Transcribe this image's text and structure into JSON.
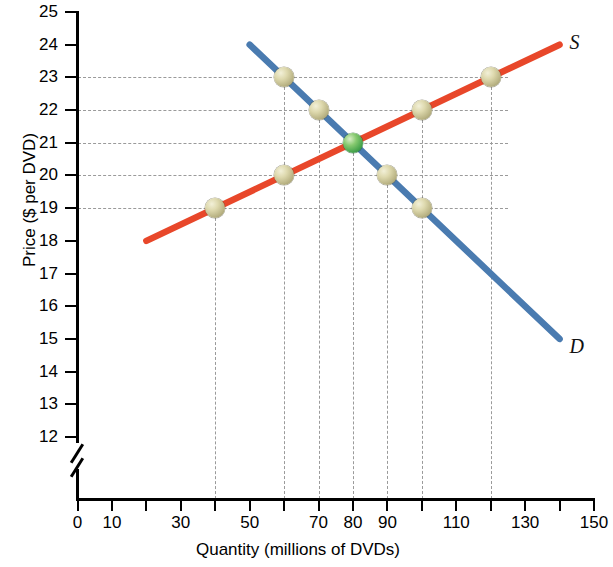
{
  "chart_data": {
    "type": "line",
    "title": "",
    "xlabel": "Quantity (millions of DVDs)",
    "ylabel": "Price ($ per DVD)",
    "xlim": [
      0,
      150
    ],
    "ylim": [
      12,
      25
    ],
    "y_axis_break_below": 12,
    "grid": true,
    "legend_position": "inline-curve-labels",
    "xticks": [
      0,
      10,
      20,
      30,
      40,
      50,
      60,
      70,
      80,
      90,
      100,
      110,
      120,
      130,
      140,
      150
    ],
    "xtick_labels": [
      "0",
      "10",
      "",
      "30",
      "",
      "50",
      "",
      "70",
      "80",
      "90",
      "",
      "110",
      "",
      "130",
      "",
      "150"
    ],
    "yticks": [
      12,
      13,
      14,
      15,
      16,
      17,
      18,
      19,
      20,
      21,
      22,
      23,
      24,
      25
    ],
    "ytick_labels": [
      "12",
      "13",
      "14",
      "15",
      "16",
      "17",
      "18",
      "19",
      "20",
      "21",
      "22",
      "23",
      "24",
      "25"
    ],
    "gridline_prices": [
      19,
      20,
      21,
      22,
      23
    ],
    "gridline_quantities": [
      40,
      60,
      70,
      80,
      90,
      100,
      120
    ],
    "series": [
      {
        "name": "Supply",
        "label": "S",
        "color": "#E8472A",
        "line_from": {
          "x": 20,
          "y": 18
        },
        "line_to": {
          "x": 140,
          "y": 24
        },
        "x": [
          40,
          60,
          80,
          100,
          120
        ],
        "values": [
          19,
          20,
          21,
          22,
          23
        ],
        "marker_color": "#ded9ae"
      },
      {
        "name": "Demand",
        "label": "D",
        "color": "#4A7BB0",
        "line_from": {
          "x": 50,
          "y": 24
        },
        "line_to": {
          "x": 140,
          "y": 15
        },
        "x": [
          60,
          70,
          80,
          90,
          100
        ],
        "values": [
          23,
          22,
          21,
          20,
          19
        ],
        "marker_color": "#ded9ae"
      }
    ],
    "equilibrium": {
      "x": 80,
      "y": 21,
      "marker_color": "#44a24b"
    },
    "points": [
      {
        "curve": "Supply",
        "x": 40,
        "y": 19,
        "kind": "normal"
      },
      {
        "curve": "Supply",
        "x": 60,
        "y": 20,
        "kind": "normal"
      },
      {
        "curve": "Supply",
        "x": 100,
        "y": 22,
        "kind": "normal"
      },
      {
        "curve": "Supply",
        "x": 120,
        "y": 23,
        "kind": "normal"
      },
      {
        "curve": "Demand",
        "x": 60,
        "y": 23,
        "kind": "normal"
      },
      {
        "curve": "Demand",
        "x": 70,
        "y": 22,
        "kind": "normal"
      },
      {
        "curve": "Demand",
        "x": 90,
        "y": 20,
        "kind": "normal"
      },
      {
        "curve": "Demand",
        "x": 100,
        "y": 19,
        "kind": "normal"
      },
      {
        "curve": "Both",
        "x": 80,
        "y": 21,
        "kind": "equilibrium"
      }
    ]
  }
}
